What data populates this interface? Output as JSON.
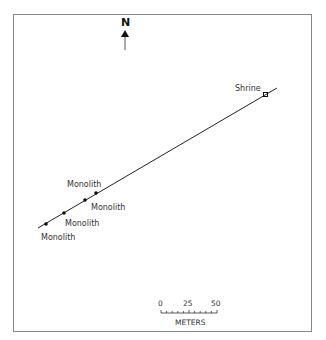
{
  "map": {
    "north_label": "N",
    "features": [
      {
        "name": "Shrine",
        "type": "square"
      },
      {
        "name": "Monolith",
        "type": "dot"
      },
      {
        "name": "Monolith",
        "type": "dot"
      },
      {
        "name": "Monolith",
        "type": "dot"
      },
      {
        "name": "Monolith",
        "type": "dot"
      }
    ],
    "labels": {
      "shrine": "Shrine",
      "monolith_1": "Monolith",
      "monolith_2": "Monolith",
      "monolith_3": "Monolith",
      "monolith_4": "Monolith"
    },
    "scale": {
      "ticks": [
        "0",
        "25",
        "50"
      ],
      "unit": "METERS"
    },
    "colors": {
      "line": "#222222",
      "frame": "#888888"
    }
  }
}
